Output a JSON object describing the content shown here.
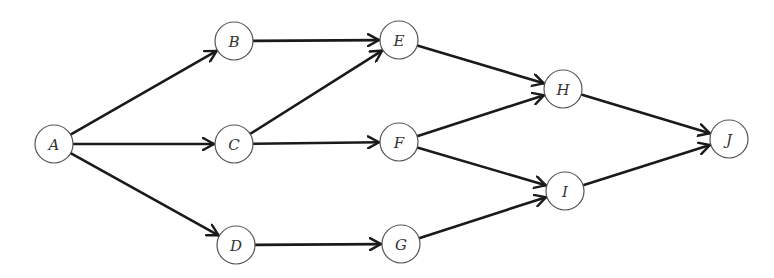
{
  "diagram": {
    "type": "directed-graph",
    "node_radius": 19,
    "colors": {
      "edge": "#1a1a1a",
      "node_stroke": "#555555",
      "node_fill": "#ffffff",
      "label": "#333333",
      "background": "#ffffff"
    },
    "nodes": [
      {
        "id": "A",
        "label": "A",
        "x": 54,
        "y": 144
      },
      {
        "id": "B",
        "label": "B",
        "x": 234,
        "y": 41
      },
      {
        "id": "C",
        "label": "C",
        "x": 234,
        "y": 144
      },
      {
        "id": "D",
        "label": "D",
        "x": 236,
        "y": 245
      },
      {
        "id": "E",
        "label": "E",
        "x": 399,
        "y": 40
      },
      {
        "id": "F",
        "label": "F",
        "x": 399,
        "y": 142
      },
      {
        "id": "G",
        "label": "G",
        "x": 401,
        "y": 244
      },
      {
        "id": "H",
        "label": "H",
        "x": 563,
        "y": 89
      },
      {
        "id": "I",
        "label": "I",
        "x": 565,
        "y": 191
      },
      {
        "id": "J",
        "label": "J",
        "x": 729,
        "y": 139
      }
    ],
    "edges": [
      {
        "from": "A",
        "to": "B"
      },
      {
        "from": "A",
        "to": "C"
      },
      {
        "from": "A",
        "to": "D"
      },
      {
        "from": "B",
        "to": "E"
      },
      {
        "from": "C",
        "to": "E"
      },
      {
        "from": "C",
        "to": "F"
      },
      {
        "from": "D",
        "to": "G"
      },
      {
        "from": "E",
        "to": "H"
      },
      {
        "from": "F",
        "to": "H"
      },
      {
        "from": "F",
        "to": "I"
      },
      {
        "from": "G",
        "to": "I"
      },
      {
        "from": "H",
        "to": "J"
      },
      {
        "from": "I",
        "to": "J"
      }
    ]
  }
}
